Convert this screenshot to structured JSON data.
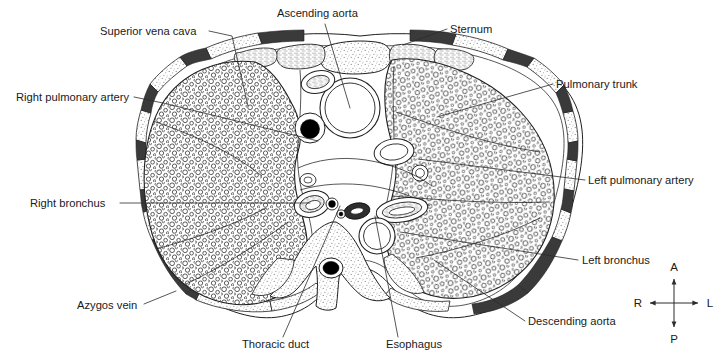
{
  "figure": {
    "orientation_note": "Viewed from below; anterior at top",
    "background_color": "#ffffff",
    "ink_color": "#1f1f1f",
    "muscle_color": "#3a3a3a",
    "lumen_color": "#000000",
    "bone_stipple_color": "#9a9a9a"
  },
  "labels": [
    {
      "id": "superior-vena-cava",
      "text": "Superior vena cava",
      "text_x": 100,
      "text_y": 35,
      "anchor": "start",
      "leader": [
        [
          209,
          31
        ],
        [
          232,
          36
        ],
        [
          248,
          106
        ]
      ]
    },
    {
      "id": "ascending-aorta",
      "text": "Ascending aorta",
      "text_x": 277,
      "text_y": 17,
      "anchor": "start",
      "leader": [
        [
          325,
          24
        ],
        [
          350,
          108
        ]
      ]
    },
    {
      "id": "sternum",
      "text": "Sternum",
      "text_x": 450,
      "text_y": 33,
      "anchor": "start",
      "leader": [
        [
          447,
          29
        ],
        [
          403,
          45
        ]
      ]
    },
    {
      "id": "pulmonary-trunk",
      "text": "Pulmonary trunk",
      "text_x": 556,
      "text_y": 88,
      "anchor": "start",
      "leader": [
        [
          553,
          84
        ],
        [
          437,
          117
        ]
      ]
    },
    {
      "id": "right-pulmonary-artery",
      "text": "Right pulmonary artery",
      "text_x": 16,
      "text_y": 101,
      "anchor": "start",
      "leader": [
        [
          134,
          97
        ],
        [
          163,
          103
        ],
        [
          318,
          141
        ]
      ]
    },
    {
      "id": "left-pulmonary-artery",
      "text": "Left pulmonary artery",
      "text_x": 588,
      "text_y": 184,
      "anchor": "start",
      "leader": [
        [
          585,
          180
        ],
        [
          418,
          159
        ]
      ]
    },
    {
      "id": "right-bronchus",
      "text": "Right bronchus",
      "text_x": 30,
      "text_y": 207,
      "anchor": "start",
      "leader": [
        [
          120,
          203
        ],
        [
          310,
          203
        ]
      ]
    },
    {
      "id": "left-bronchus",
      "text": "Left bronchus",
      "text_x": 582,
      "text_y": 264,
      "anchor": "start",
      "leader": [
        [
          578,
          260
        ],
        [
          400,
          232
        ]
      ]
    },
    {
      "id": "azygos-vein",
      "text": "Azygos vein",
      "text_x": 77,
      "text_y": 309,
      "anchor": "start",
      "leader": [
        [
          144,
          304
        ],
        [
          176,
          291
        ]
      ]
    },
    {
      "id": "descending-aorta",
      "text": "Descending aorta",
      "text_x": 528,
      "text_y": 325,
      "anchor": "start",
      "leader": [
        [
          525,
          321
        ],
        [
          434,
          260
        ]
      ]
    },
    {
      "id": "thoracic-duct",
      "text": "Thoracic duct",
      "text_x": 242,
      "text_y": 348,
      "anchor": "start",
      "leader": [
        [
          283,
          337
        ],
        [
          340,
          206
        ]
      ]
    },
    {
      "id": "esophagus",
      "text": "Esophagus",
      "text_x": 386,
      "text_y": 348,
      "anchor": "start",
      "leader": [
        [
          398,
          337
        ],
        [
          375,
          216
        ]
      ]
    }
  ],
  "compass": {
    "center_x": 674,
    "center_y": 303,
    "arm": 24,
    "anterior": "A",
    "posterior": "P",
    "right": "R",
    "left": "L"
  }
}
